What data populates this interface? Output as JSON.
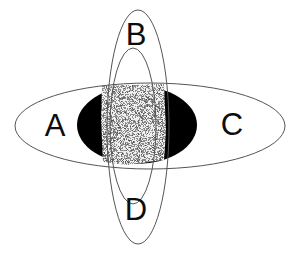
{
  "diagram": {
    "type": "venn-diagram",
    "background_color": "#ffffff",
    "outline_color": "#555555",
    "fill_black": "#000000",
    "noise_light": "#dcdcdc",
    "noise_dark": "#1a1a1a",
    "label_color": "#0d0d0d",
    "labels": [
      {
        "id": "A",
        "text": "A",
        "x": 55,
        "y": 128,
        "region": "left-horizontal-ellipse"
      },
      {
        "id": "B",
        "text": "B",
        "x": 136,
        "y": 37,
        "region": "top-vertical-ellipse"
      },
      {
        "id": "C",
        "text": "C",
        "x": 232,
        "y": 127,
        "region": "right-horizontal-ellipse"
      },
      {
        "id": "D",
        "text": "D",
        "x": 136,
        "y": 212,
        "region": "bottom-vertical-ellipse"
      }
    ],
    "shapes": [
      {
        "id": "outer-horizontal-ellipse",
        "name": "outer-horizontal-ellipse",
        "kind": "ellipse",
        "cx": 150,
        "cy": 126,
        "rx": 135,
        "ry": 43,
        "fill": "none",
        "stroke": "#555555",
        "stroke_width": 1
      },
      {
        "id": "inner-black-ellipse",
        "name": "inner-black-ellipse",
        "kind": "ellipse",
        "cx": 137,
        "cy": 125,
        "rx": 60,
        "ry": 39,
        "fill": "#000000",
        "stroke": "none",
        "stroke_width": 0
      },
      {
        "id": "outer-vertical-ellipse",
        "name": "outer-vertical-ellipse",
        "kind": "ellipse",
        "cx": 138,
        "cy": 127,
        "rx": 31,
        "ry": 117,
        "fill": "none",
        "stroke": "#555555",
        "stroke_width": 1
      },
      {
        "id": "inner-vertical-ellipse",
        "name": "inner-vertical-ellipse",
        "kind": "ellipse",
        "cx": 133,
        "cy": 126,
        "rx": 23,
        "ry": 78,
        "fill": "none",
        "stroke": "#555555",
        "stroke_width": 1
      },
      {
        "id": "noise-patch",
        "name": "center-noise-patch",
        "kind": "quad",
        "x": 101,
        "y": 85,
        "width": 64,
        "height": 79,
        "fill": "noise-texture"
      }
    ]
  }
}
